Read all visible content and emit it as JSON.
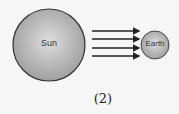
{
  "diagram": {
    "sun_label": "Sun",
    "earth_label": "Earth",
    "caption": "(2)",
    "arrow_count": 4,
    "colors": {
      "body_fill": "#b5b5b5",
      "outline": "#333333",
      "background": "#f6f6f6"
    }
  }
}
